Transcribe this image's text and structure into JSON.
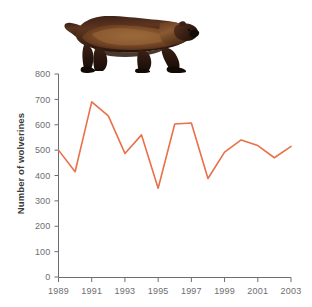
{
  "figure": {
    "photo": {
      "name": "wolverine-photograph",
      "subject": "wolverine",
      "alt": "Photograph of a wolverine walking to the right"
    },
    "colors": {
      "line": "#e8714a",
      "axis": "#6d6e70",
      "tick_text": "#6d6e70",
      "axis_title": "#3b3b3d",
      "background": "#ffffff"
    }
  },
  "chart_data": {
    "type": "line",
    "title": "",
    "xlabel": "",
    "ylabel": "Number of wolverines",
    "x": [
      1989,
      1990,
      1991,
      1992,
      1993,
      1994,
      1995,
      1996,
      1997,
      1998,
      1999,
      2000,
      2001,
      2002,
      2003
    ],
    "values": [
      500,
      415,
      690,
      635,
      487,
      560,
      350,
      603,
      607,
      388,
      492,
      540,
      518,
      470,
      515
    ],
    "series": [
      {
        "name": "Number of wolverines",
        "values": [
          500,
          415,
          690,
          635,
          487,
          560,
          350,
          603,
          607,
          388,
          492,
          540,
          518,
          470,
          515
        ]
      }
    ],
    "xlim": [
      1989,
      2003
    ],
    "ylim": [
      0,
      800
    ],
    "xticks": [
      1989,
      1991,
      1993,
      1995,
      1997,
      1999,
      2001,
      2003
    ],
    "xtick_labels": [
      "1989",
      "1991",
      "1993",
      "1995",
      "1997",
      "1999",
      "2001",
      "2003"
    ],
    "yticks": [
      0,
      100,
      200,
      300,
      400,
      500,
      600,
      700,
      800
    ],
    "ytick_labels": [
      "0",
      "100",
      "200",
      "300",
      "400",
      "500",
      "600",
      "700",
      "800"
    ],
    "grid": false,
    "legend": false,
    "markers": false
  }
}
